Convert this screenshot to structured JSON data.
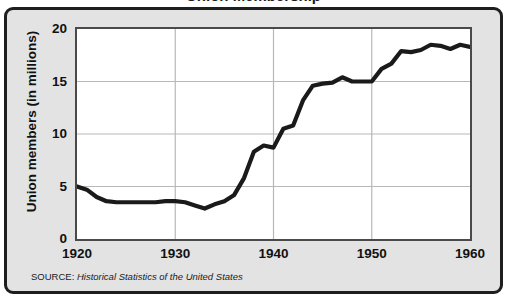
{
  "figure": {
    "title": "Union Membership",
    "source_label": "SOURCE:",
    "source_title": "Historical Statistics of the United States",
    "panel_color": "#e3e3e3",
    "plot_bg_color": "#ffffff",
    "line_color": "#1a1a1a",
    "grid_color": "#b8b8b8",
    "frame_color": "#1e1e1e"
  },
  "chart_data": {
    "type": "line",
    "title": "Union Membership",
    "xlabel": "",
    "ylabel": "Union members (in millions)",
    "xlim": [
      1920,
      1960
    ],
    "ylim": [
      0,
      20
    ],
    "xticks": [
      "1920",
      "1930",
      "1940",
      "1950",
      "1960"
    ],
    "yticks": [
      "0",
      "5",
      "10",
      "15",
      "20"
    ],
    "grid": true,
    "legend": "none",
    "series": [
      {
        "name": "Union members (in millions)",
        "x": [
          1920,
          1921,
          1922,
          1923,
          1924,
          1925,
          1926,
          1927,
          1928,
          1929,
          1930,
          1931,
          1932,
          1933,
          1934,
          1935,
          1936,
          1937,
          1938,
          1939,
          1940,
          1941,
          1942,
          1943,
          1944,
          1945,
          1946,
          1947,
          1948,
          1949,
          1950,
          1951,
          1952,
          1953,
          1954,
          1955,
          1956,
          1957,
          1958,
          1959,
          1960
        ],
        "values": [
          5.0,
          4.7,
          4.0,
          3.6,
          3.5,
          3.5,
          3.5,
          3.5,
          3.5,
          3.6,
          3.6,
          3.5,
          3.2,
          2.9,
          3.3,
          3.6,
          4.2,
          5.8,
          8.3,
          8.9,
          8.7,
          10.5,
          10.8,
          13.2,
          14.6,
          14.8,
          14.9,
          15.4,
          15.0,
          15.0,
          15.0,
          16.2,
          16.7,
          17.9,
          17.8,
          18.0,
          18.5,
          18.4,
          18.1,
          18.5,
          18.3
        ]
      }
    ]
  }
}
